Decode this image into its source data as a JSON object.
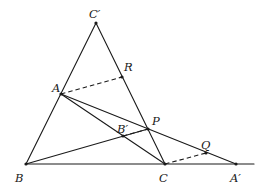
{
  "diagram": {
    "type": "geometry",
    "points": {
      "C_prime": {
        "label": "C′",
        "x": 96,
        "y": 23,
        "lx": 89,
        "ly": 18
      },
      "R": {
        "label": "R",
        "x": 122,
        "y": 77,
        "lx": 124,
        "ly": 71
      },
      "A": {
        "label": "A",
        "x": 61,
        "y": 94,
        "lx": 52,
        "ly": 92
      },
      "P": {
        "label": "P",
        "x": 148,
        "y": 129,
        "lx": 152,
        "ly": 125
      },
      "B_prime": {
        "label": "B′",
        "x": 123,
        "y": 136,
        "lx": 117,
        "ly": 133
      },
      "Q": {
        "label": "Q",
        "x": 206,
        "y": 153,
        "lx": 201,
        "ly": 149
      },
      "B": {
        "label": "B",
        "x": 26,
        "y": 164,
        "lx": 15,
        "ly": 182
      },
      "C": {
        "label": "C",
        "x": 165,
        "y": 164,
        "lx": 159,
        "ly": 182
      },
      "A_prime": {
        "label": "A′",
        "x": 236,
        "y": 164,
        "lx": 230,
        "ly": 182
      }
    },
    "solid_lines": [
      {
        "name": "line-B-Cprime",
        "x1": 26,
        "y1": 164,
        "x2": 96,
        "y2": 23
      },
      {
        "name": "line-Cprime-C",
        "x1": 96,
        "y1": 23,
        "x2": 165,
        "y2": 164
      },
      {
        "name": "line-A-C",
        "x1": 61,
        "y1": 94,
        "x2": 165,
        "y2": 164
      },
      {
        "name": "line-A-Aprime",
        "x1": 61,
        "y1": 94,
        "x2": 236,
        "y2": 164
      },
      {
        "name": "line-B-P",
        "x1": 26,
        "y1": 164,
        "x2": 148,
        "y2": 129
      },
      {
        "name": "baseline-B-Aprime",
        "x1": 26,
        "y1": 164,
        "x2": 254,
        "y2": 164
      }
    ],
    "dashed_lines": [
      {
        "name": "dashed-A-R",
        "x1": 61,
        "y1": 94,
        "x2": 122,
        "y2": 77
      },
      {
        "name": "dashed-Bprime-P",
        "x1": 123,
        "y1": 136,
        "x2": 148,
        "y2": 129
      },
      {
        "name": "dashed-C-Q",
        "x1": 165,
        "y1": 164,
        "x2": 206,
        "y2": 153
      }
    ]
  }
}
